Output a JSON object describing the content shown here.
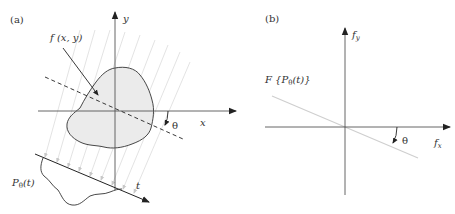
{
  "panel_a": {
    "label": "(a)",
    "axis_x_label": "x",
    "axis_y_label": "y",
    "object_label": "f (x, y)",
    "angle_label": "θ",
    "projection_axis_label": "t",
    "projection_label_main": "P",
    "projection_label_sub": "θ",
    "projection_label_arg": "(t)"
  },
  "panel_b": {
    "label": "(b)",
    "axis_x_label_main": "f",
    "axis_x_label_sub": "x",
    "axis_y_label_main": "f",
    "axis_y_label_sub": "y",
    "slice_label": "F {P",
    "slice_label_sub": "θ",
    "slice_label_end": "(t)}",
    "angle_label": "θ"
  },
  "colors": {
    "axis": "#555555",
    "ink": "#222222",
    "object_fill": "#ececec",
    "rays": "#d6d6d6",
    "slice_line": "#cfcfcf"
  }
}
